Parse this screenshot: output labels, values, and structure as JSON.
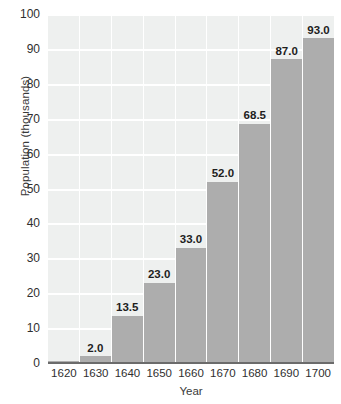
{
  "chart_data": {
    "type": "bar",
    "title": "",
    "subtitle": "",
    "xlabel": "Year",
    "ylabel": "Population (thousands)",
    "categories": [
      "1620",
      "1630",
      "1640",
      "1650",
      "1660",
      "1670",
      "1680",
      "1690",
      "1700"
    ],
    "values": [
      0.5,
      2.0,
      13.5,
      23.0,
      33.0,
      52.0,
      68.5,
      87.0,
      93.0
    ],
    "data_labels": [
      "",
      "2.0",
      "13.5",
      "23.0",
      "33.0",
      "52.0",
      "68.5",
      "87.0",
      "93.0"
    ],
    "ylim": [
      0,
      100
    ],
    "xlim_categories": 9,
    "y_ticks": [
      0,
      10,
      20,
      30,
      40,
      50,
      60,
      70,
      80,
      90,
      100
    ],
    "y_tick_labels": [
      "0",
      "10",
      "20",
      "30",
      "40",
      "50",
      "60",
      "70",
      "80",
      "90",
      "100"
    ],
    "grid": true,
    "grid_axis": "y",
    "legend": false,
    "legend_position": "none",
    "annotations": []
  },
  "style": {
    "plot_background": "#eef0ef",
    "bar_color": "#adadad",
    "gridline_color": "#ffffff",
    "axis_line_color": "#6b6b6b",
    "tick_label_color": "#2f2f2f",
    "axis_title_color": "#3a3a3a",
    "data_label_color": "#1e1e1e",
    "figure_background": "#ffffff"
  }
}
